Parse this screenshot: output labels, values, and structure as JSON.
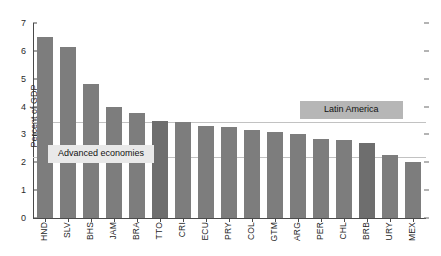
{
  "chart_data": {
    "type": "bar",
    "title": "",
    "subtitle": "",
    "xlabel": "",
    "ylabel": "Percent of GDP",
    "ylim": [
      0,
      7
    ],
    "yticks": [
      0,
      1,
      2,
      3,
      4,
      5,
      6,
      7
    ],
    "grid": false,
    "legend_position": "inline-annotations",
    "bar_color": "#7d7d7d",
    "categories": [
      "HND",
      "SLV",
      "BHS",
      "JAM",
      "BRA",
      "TTO",
      "CRI",
      "ECU",
      "PRY",
      "COL",
      "GTM",
      "ARG",
      "PER",
      "CHL",
      "BRB",
      "URY",
      "MEX"
    ],
    "values": [
      6.5,
      6.15,
      4.8,
      3.97,
      3.78,
      3.5,
      3.45,
      3.3,
      3.25,
      3.15,
      3.1,
      3.0,
      2.85,
      2.8,
      2.7,
      2.25,
      2.0
    ],
    "reference_lines": [
      {
        "name": "Latin America",
        "value": 3.45,
        "color": "#b6b6b6"
      },
      {
        "name": "Advanced economies",
        "value": 2.2,
        "color": "#e9e9e9"
      }
    ],
    "annotations": [
      {
        "text": "Latin America"
      },
      {
        "text": "Advanced economies"
      }
    ]
  },
  "axis": {
    "y_tick_labels": [
      "0",
      "1",
      "2",
      "3",
      "4",
      "5",
      "6",
      "7"
    ],
    "y_title": "Percent of GDP"
  }
}
